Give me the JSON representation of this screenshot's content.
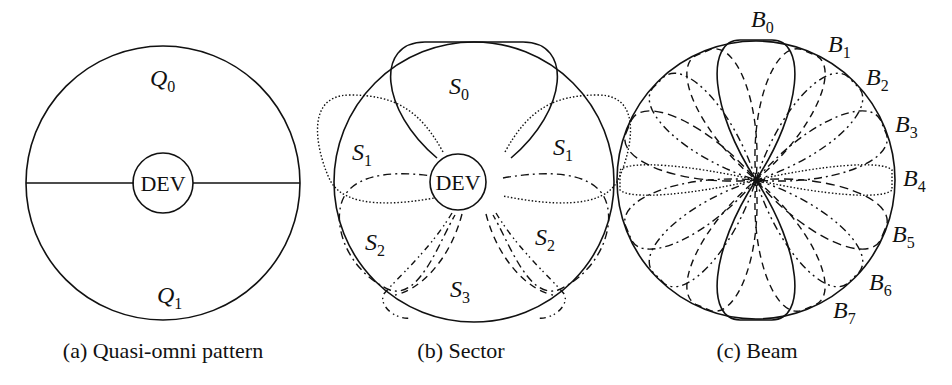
{
  "panels": [
    {
      "id": "a",
      "caption": "(a) Quasi-omni pattern",
      "center_label": "DEV",
      "regions": [
        {
          "name": "Q",
          "sub": "0",
          "position": "top"
        },
        {
          "name": "Q",
          "sub": "1",
          "position": "bottom"
        }
      ]
    },
    {
      "id": "b",
      "caption": "(b) Sector",
      "center_label": "DEV",
      "regions": [
        {
          "name": "S",
          "sub": "0",
          "position": "top"
        },
        {
          "name": "S",
          "sub": "1",
          "position": "upper-left"
        },
        {
          "name": "S",
          "sub": "1",
          "position": "upper-right"
        },
        {
          "name": "S",
          "sub": "2",
          "position": "lower-left"
        },
        {
          "name": "S",
          "sub": "2",
          "position": "lower-right"
        },
        {
          "name": "S",
          "sub": "3",
          "position": "bottom"
        }
      ]
    },
    {
      "id": "c",
      "caption": "(c) Beam",
      "beams": [
        {
          "name": "B",
          "sub": "0"
        },
        {
          "name": "B",
          "sub": "1"
        },
        {
          "name": "B",
          "sub": "2"
        },
        {
          "name": "B",
          "sub": "3"
        },
        {
          "name": "B",
          "sub": "4"
        },
        {
          "name": "B",
          "sub": "5"
        },
        {
          "name": "B",
          "sub": "6"
        },
        {
          "name": "B",
          "sub": "7"
        }
      ]
    }
  ],
  "colors": {
    "line": "#111111",
    "background": "#ffffff"
  }
}
